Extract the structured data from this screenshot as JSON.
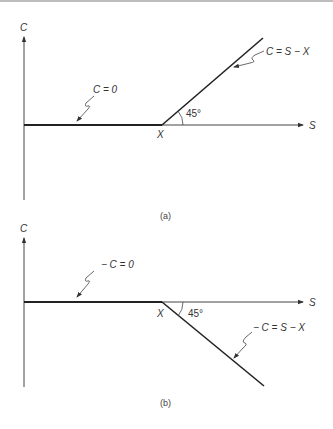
{
  "panels": [
    {
      "id": "a",
      "caption": "(a)",
      "y_axis_label": "C",
      "x_axis_label": "S",
      "strike_label": "X",
      "angle_label": "45°",
      "flat_label": "C = 0",
      "slope_label": "C = S − X"
    },
    {
      "id": "b",
      "caption": "(b)",
      "y_axis_label": "C",
      "x_axis_label": "S",
      "strike_label": "X",
      "angle_label": "45°",
      "flat_label": "− C = 0",
      "slope_label": "− C = S − X"
    }
  ]
}
